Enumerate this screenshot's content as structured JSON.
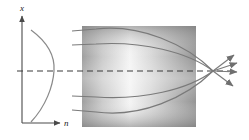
{
  "figure": {
    "name": "grin-lens-ray-diagram",
    "background": "#ffffff"
  },
  "index_profile_plot": {
    "vertical_axis": {
      "label": "x",
      "x": 22,
      "y_top": 14,
      "y_bottom": 123,
      "color": "#555555"
    },
    "horizontal_axis": {
      "label": "n",
      "y": 123,
      "x_left": 22,
      "x_right": 62,
      "color": "#555555"
    },
    "curve": {
      "name": "parabolic-index-profile",
      "color": "#808080",
      "peak_x": 54,
      "peak_y": 71,
      "top_x": 31,
      "top_y": 30,
      "bottom_x": 31,
      "bottom_y": 122
    }
  },
  "medium": {
    "name": "grin-medium-slab",
    "x": 82,
    "y": 26,
    "width": 114,
    "height": 101,
    "gradient_light": "#fbfbfb",
    "gradient_dark": "#8f8f8f"
  },
  "optical_axis": {
    "name": "optical-axis-dashed-line",
    "y": 71,
    "x_start": 17,
    "x_end": 236,
    "color": "#333333",
    "dash": "6 4"
  },
  "rays": {
    "color": "#7a7a7a",
    "entry_x": 72,
    "focus_x": 213,
    "focus_y": 71,
    "incoming": [
      {
        "id": "ray-upper-outer",
        "entry_y": 31,
        "bulge_y": 22
      },
      {
        "id": "ray-upper-inner",
        "entry_y": 45,
        "bulge_y": 40
      },
      {
        "id": "ray-lower-inner",
        "entry_y": 96,
        "bulge_y": 101
      },
      {
        "id": "ray-lower-outer",
        "entry_y": 110,
        "bulge_y": 119
      }
    ],
    "outgoing": [
      {
        "id": "arrow-out-1",
        "end_x": 237,
        "end_y": 53
      },
      {
        "id": "arrow-out-2",
        "end_x": 241,
        "end_y": 62
      },
      {
        "id": "arrow-out-3",
        "end_x": 241,
        "end_y": 72
      },
      {
        "id": "arrow-out-4",
        "end_x": 237,
        "end_y": 88
      }
    ]
  }
}
